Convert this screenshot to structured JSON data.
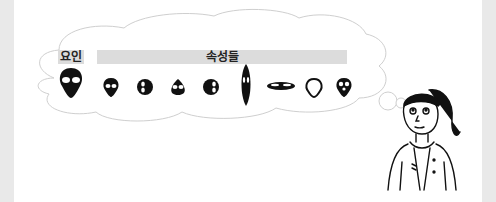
{
  "labels": {
    "factor": "요인",
    "attributes": "속성들"
  },
  "icons": {
    "factor_face": "alien-face-large-icon",
    "attribute_faces": [
      "alien-face-small-icon",
      "alien-face-turned-left-icon",
      "alien-face-looking-up-icon",
      "alien-face-turned-right-icon",
      "alien-face-tall-narrow-icon",
      "alien-face-wide-flat-icon",
      "alien-face-outline-icon",
      "alien-face-small-variant-icon"
    ]
  },
  "figures": {
    "thinker": "girl-thinking-illustration",
    "bubble": "thought-cloud"
  },
  "colors": {
    "background": "#e9e9e9",
    "panel": "#ffffff",
    "label_bar": "#dcdcdc",
    "ink": "#111111",
    "cloud_line": "#cfcfcf"
  }
}
